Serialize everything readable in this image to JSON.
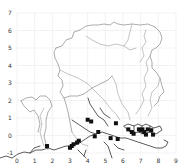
{
  "figure": {
    "type": "map",
    "colors": {
      "background": "#ffffff",
      "grid": "#e4e4e4",
      "outline": "#8a8a8a",
      "river": "#9a9a9a",
      "coast": "#333333",
      "marker": "#111111",
      "tick_text": "#333333"
    },
    "x_axis": {
      "ticks": [
        "0",
        "1",
        "2",
        "3",
        "4",
        "5",
        "6",
        "7",
        "8",
        "9"
      ],
      "range": [
        0,
        9
      ]
    },
    "y_axis": {
      "ticks": [
        "7",
        "6",
        "5",
        "4",
        "3",
        "2",
        "1",
        "0",
        "-1"
      ],
      "range": [
        -1,
        7
      ]
    },
    "grid": true
  },
  "chart_data": {
    "type": "scatter",
    "title": "",
    "xlabel": "",
    "ylabel": "",
    "xlim": [
      0,
      9
    ],
    "ylim": [
      -1,
      7
    ],
    "grid": true,
    "series": [
      {
        "name": "sites",
        "marker": "square",
        "points": [
          [
            1.7,
            -0.6
          ],
          [
            3.0,
            -0.7
          ],
          [
            3.1,
            -0.6
          ],
          [
            3.2,
            -0.5
          ],
          [
            3.4,
            -0.4
          ],
          [
            3.5,
            -0.3
          ],
          [
            4.0,
            0.9
          ],
          [
            4.2,
            0.8
          ],
          [
            4.6,
            0.2
          ],
          [
            4.4,
            -0.05
          ],
          [
            5.3,
            -0.15
          ],
          [
            5.7,
            -0.2
          ],
          [
            6.3,
            0.35
          ],
          [
            6.5,
            0.2
          ],
          [
            6.6,
            0.1
          ],
          [
            6.9,
            0.35
          ],
          [
            7.0,
            0.3
          ],
          [
            7.1,
            0.35
          ],
          [
            7.2,
            0.2
          ],
          [
            7.4,
            0.35
          ],
          [
            7.3,
            0.05
          ],
          [
            7.6,
            0.3
          ],
          [
            7.7,
            0.05
          ],
          [
            5.6,
            0.7
          ]
        ]
      }
    ]
  }
}
